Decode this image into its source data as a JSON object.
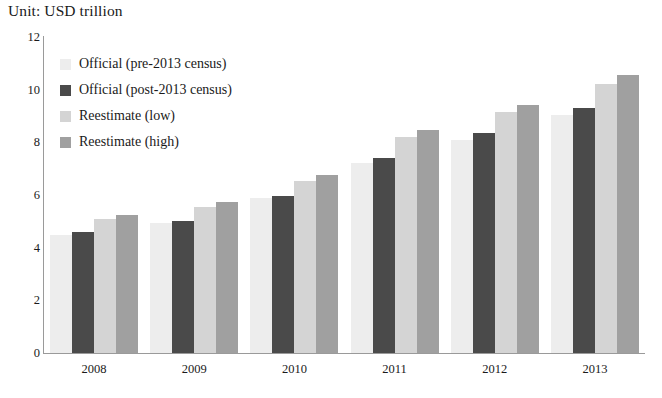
{
  "unit_label": "Unit: USD trillion",
  "legend": {
    "position": "inside-top-left",
    "items": [
      {
        "label": "Official (pre-2013 census)",
        "color": "#ededed"
      },
      {
        "label": "Official (post-2013 census)",
        "color": "#4a4a4a"
      },
      {
        "label": "Reestimate (low)",
        "color": "#d4d4d4"
      },
      {
        "label": "Reestimate (high)",
        "color": "#a0a0a0"
      }
    ]
  },
  "axis": {
    "y_ticks": [
      "12",
      "10",
      "8",
      "6",
      "4",
      "2",
      "0"
    ],
    "y_tick_values": [
      12,
      10,
      8,
      6,
      4,
      2,
      0
    ],
    "x_ticks": [
      "2008",
      "2009",
      "2010",
      "2011",
      "2012",
      "2013"
    ]
  },
  "chart_data": {
    "type": "bar",
    "title": "Unit: USD trillion",
    "subtitle": "",
    "xlabel": "",
    "ylabel": "",
    "ylim": [
      0,
      12
    ],
    "ytick_step": 2,
    "grid": false,
    "legend_position": "inside-top-left",
    "categories": [
      "2008",
      "2009",
      "2010",
      "2011",
      "2012",
      "2013"
    ],
    "series": [
      {
        "name": "Official (pre-2013 census)",
        "color": "#ededed",
        "values": [
          4.5,
          4.95,
          5.9,
          7.2,
          8.1,
          9.05
        ]
      },
      {
        "name": "Official (post-2013 census)",
        "color": "#4a4a4a",
        "values": [
          4.6,
          5.0,
          5.95,
          7.4,
          8.35,
          9.3
        ]
      },
      {
        "name": "Reestimate (low)",
        "color": "#d4d4d4",
        "values": [
          5.1,
          5.55,
          6.55,
          8.2,
          9.15,
          10.2
        ]
      },
      {
        "name": "Reestimate (high)",
        "color": "#a0a0a0",
        "values": [
          5.25,
          5.75,
          6.75,
          8.45,
          9.4,
          10.55
        ]
      }
    ]
  }
}
